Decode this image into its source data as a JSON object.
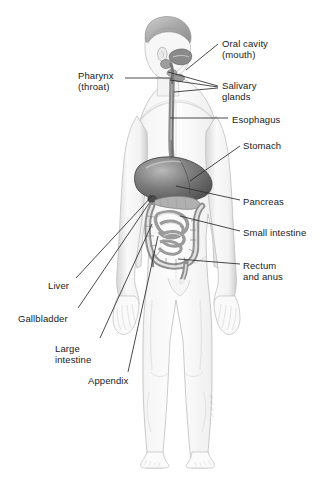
{
  "figure": {
    "view": "full-body anterior-oblique grayscale medical illustration",
    "background_color": "#ffffff",
    "ink_color": "#1a1a1a",
    "skin_tone": "#f4f4f4",
    "shade_color": "#c9c9c9",
    "organ_dark": "#5a5a5a",
    "organ_mid": "#9a9a9a",
    "organ_light": "#d8d8d8"
  },
  "labels": [
    {
      "id": "oral-cavity",
      "text": "Oral cavity\n(mouth)",
      "x": 222,
      "y": 38,
      "side": "right"
    },
    {
      "id": "pharynx",
      "text": "Pharynx\n(throat)",
      "x": 78,
      "y": 70,
      "side": "left"
    },
    {
      "id": "salivary-glands",
      "text": "Salivary\nglands",
      "x": 222,
      "y": 80,
      "side": "right"
    },
    {
      "id": "esophagus",
      "text": "Esophagus",
      "x": 232,
      "y": 114,
      "side": "right"
    },
    {
      "id": "stomach",
      "text": "Stomach",
      "x": 243,
      "y": 140,
      "side": "right"
    },
    {
      "id": "pancreas",
      "text": "Pancreas",
      "x": 243,
      "y": 196,
      "side": "right"
    },
    {
      "id": "small-intestine",
      "text": "Small intestine",
      "x": 243,
      "y": 227,
      "side": "right"
    },
    {
      "id": "rectum-anus",
      "text": "Rectum\nand anus",
      "x": 243,
      "y": 260,
      "side": "right"
    },
    {
      "id": "liver",
      "text": "Liver",
      "x": 48,
      "y": 280,
      "side": "left"
    },
    {
      "id": "gallbladder",
      "text": "Gallbladder",
      "x": 18,
      "y": 313,
      "side": "left"
    },
    {
      "id": "large-intestine",
      "text": "Large\nintestine",
      "x": 55,
      "y": 343,
      "side": "left"
    },
    {
      "id": "appendix",
      "text": "Appendix",
      "x": 88,
      "y": 375,
      "side": "left"
    }
  ],
  "leader_lines": [
    {
      "id": "leader-oral-cavity",
      "from": [
        218,
        44
      ],
      "to": [
        186,
        70
      ]
    },
    {
      "id": "leader-pharynx",
      "from": [
        125,
        78
      ],
      "to": [
        172,
        78
      ]
    },
    {
      "id": "leader-salivary-1",
      "from": [
        218,
        86
      ],
      "to": [
        168,
        72
      ]
    },
    {
      "id": "leader-salivary-2",
      "from": [
        218,
        87
      ],
      "to": [
        170,
        80
      ]
    },
    {
      "id": "leader-salivary-3",
      "from": [
        218,
        88
      ],
      "to": [
        174,
        92
      ]
    },
    {
      "id": "leader-esophagus",
      "from": [
        228,
        118
      ],
      "to": [
        170,
        118
      ]
    },
    {
      "id": "leader-stomach",
      "from": [
        240,
        146
      ],
      "to": [
        190,
        181
      ]
    },
    {
      "id": "leader-pancreas",
      "from": [
        240,
        200
      ],
      "to": [
        176,
        186
      ]
    },
    {
      "id": "leader-small-intestine",
      "from": [
        240,
        231
      ],
      "to": [
        180,
        216
      ]
    },
    {
      "id": "leader-rectum-anus",
      "from": [
        240,
        264
      ],
      "to": [
        178,
        259
      ]
    },
    {
      "id": "leader-liver",
      "from": [
        76,
        278
      ],
      "to": [
        152,
        196
      ]
    },
    {
      "id": "leader-gallbladder",
      "from": [
        78,
        308
      ],
      "to": [
        150,
        202
      ]
    },
    {
      "id": "leader-large-intestine",
      "from": [
        100,
        338
      ],
      "to": [
        152,
        224
      ]
    },
    {
      "id": "leader-appendix",
      "from": [
        128,
        372
      ],
      "to": [
        158,
        236
      ]
    }
  ],
  "organs": [
    {
      "id": "oral-cavity",
      "name": "Oral cavity (mouth)"
    },
    {
      "id": "pharynx",
      "name": "Pharynx (throat)"
    },
    {
      "id": "salivary-glands",
      "name": "Salivary glands"
    },
    {
      "id": "esophagus",
      "name": "Esophagus"
    },
    {
      "id": "stomach",
      "name": "Stomach"
    },
    {
      "id": "liver",
      "name": "Liver"
    },
    {
      "id": "gallbladder",
      "name": "Gallbladder"
    },
    {
      "id": "pancreas",
      "name": "Pancreas"
    },
    {
      "id": "small-intestine",
      "name": "Small intestine"
    },
    {
      "id": "large-intestine",
      "name": "Large intestine"
    },
    {
      "id": "appendix",
      "name": "Appendix"
    },
    {
      "id": "rectum-anus",
      "name": "Rectum and anus"
    }
  ]
}
